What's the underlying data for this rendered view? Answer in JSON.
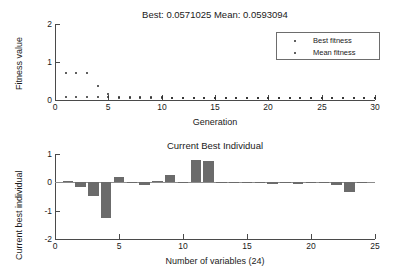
{
  "figure": {
    "background": "#ffffff",
    "axis_color": "#4a4a4a",
    "bar_color": "#6b6b6b",
    "marker_color": "#2b2b2b"
  },
  "fitness_plot": {
    "title": "Best: 0.0571025 Mean: 0.0593094",
    "xlabel": "Generation",
    "ylabel": "Fitness value",
    "xticks": [
      "0",
      "5",
      "10",
      "15",
      "20",
      "25",
      "30"
    ],
    "yticks": [
      "0",
      "1",
      "2"
    ],
    "legend": {
      "best_label": "Best fitness",
      "mean_label": "Mean fitness"
    }
  },
  "individual_plot": {
    "title": "Current Best Individual",
    "xlabel": "Number of variables (24)",
    "ylabel": "Current best individual",
    "xticks": [
      "0",
      "5",
      "10",
      "15",
      "20",
      "25"
    ],
    "yticks": [
      "1",
      "0",
      "-1",
      "-2"
    ]
  },
  "chart_data": [
    {
      "type": "scatter",
      "title": "Best: 0.0571025 Mean: 0.0593094",
      "xlabel": "Generation",
      "ylabel": "Fitness value",
      "xlim": [
        0,
        30
      ],
      "ylim": [
        0,
        2
      ],
      "grid": false,
      "legend_position": "top-right",
      "x": [
        1,
        2,
        3,
        4,
        5,
        6,
        7,
        8,
        9,
        10,
        11,
        12,
        13,
        14,
        15,
        16,
        17,
        18,
        19,
        20,
        21,
        22,
        23,
        24,
        25,
        26,
        27,
        28,
        29,
        30
      ],
      "series": [
        {
          "name": "Best fitness",
          "values": [
            0.072,
            0.071,
            0.07,
            0.068,
            0.066,
            0.064,
            0.063,
            0.062,
            0.061,
            0.061,
            0.06,
            0.06,
            0.059,
            0.059,
            0.059,
            0.058,
            0.058,
            0.058,
            0.058,
            0.058,
            0.058,
            0.057,
            0.057,
            0.057,
            0.057,
            0.057,
            0.057,
            0.057,
            0.057,
            0.0571025
          ]
        },
        {
          "name": "Mean fitness",
          "values": [
            0.72,
            0.72,
            0.72,
            0.38,
            0.15,
            0.085,
            0.075,
            0.07,
            0.068,
            0.066,
            0.065,
            0.064,
            0.063,
            0.063,
            0.062,
            0.062,
            0.061,
            0.061,
            0.061,
            0.06,
            0.06,
            0.06,
            0.06,
            0.06,
            0.059,
            0.059,
            0.059,
            0.059,
            0.059,
            0.0593094
          ]
        }
      ]
    },
    {
      "type": "bar",
      "title": "Current Best Individual",
      "xlabel": "Number of variables (24)",
      "ylabel": "Current best individual",
      "xlim": [
        0,
        25
      ],
      "ylim": [
        -2,
        1
      ],
      "grid": false,
      "categories": [
        1,
        2,
        3,
        4,
        5,
        6,
        7,
        8,
        9,
        10,
        11,
        12,
        13,
        14,
        15,
        16,
        17,
        18,
        19,
        20,
        21,
        22,
        23,
        24
      ],
      "values": [
        0.03,
        -0.17,
        -0.47,
        -1.27,
        0.2,
        0.02,
        -0.11,
        0.03,
        0.27,
        0.01,
        0.8,
        0.77,
        0.0,
        0.0,
        0.0,
        0.0,
        -0.07,
        -0.04,
        -0.05,
        0.0,
        0.0,
        -0.1,
        -0.35,
        0.0
      ]
    }
  ]
}
